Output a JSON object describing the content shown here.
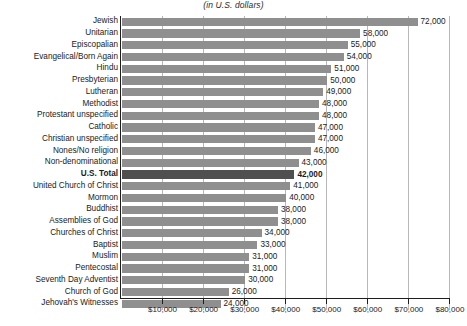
{
  "subtitle": "(in U.S. dollars)",
  "axis": {
    "tick_labels": [
      "$10,000",
      "$20,000",
      "$30,000",
      "$40,000",
      "$50,000",
      "$60,000",
      "$70,000",
      "$80,000"
    ]
  },
  "colors": {
    "bar": "#8f8f8f",
    "bar_highlight": "#4f4f4f",
    "gridline": "#b8b8b8",
    "axis": "#1d1d1d"
  },
  "chart_data": {
    "type": "bar",
    "title": "",
    "subtitle": "(in U.S. dollars)",
    "xlabel": "",
    "ylabel": "",
    "orientation": "horizontal",
    "xlim": [
      0,
      80000
    ],
    "xtick_values": [
      10000,
      20000,
      30000,
      40000,
      50000,
      60000,
      70000,
      80000
    ],
    "xtick_labels": [
      "$10,000",
      "$20,000",
      "$30,000",
      "$40,000",
      "$50,000",
      "$60,000",
      "$70,000",
      "$80,000"
    ],
    "grid": "vertical",
    "legend": "none",
    "highlight_category": "U.S. Total",
    "categories": [
      "Jewish",
      "Unitarian",
      "Episcopalian",
      "Evangelical/Born Again",
      "Hindu",
      "Presbyterian",
      "Lutheran",
      "Methodist",
      "Protestant unspecified",
      "Catholic",
      "Christian unspecified",
      "Nones/No religion",
      "Non-denominational",
      "U.S. Total",
      "United Church of Christ",
      "Mormon",
      "Buddhist",
      "Assemblies of God",
      "Churches of Christ",
      "Baptist",
      "Muslim",
      "Pentecostal",
      "Seventh Day Adventist",
      "Church of God",
      "Jehovah's Witnesses"
    ],
    "values": [
      72000,
      58000,
      55000,
      54000,
      51000,
      50000,
      49000,
      48000,
      48000,
      47000,
      47000,
      46000,
      43000,
      42000,
      41000,
      40000,
      38000,
      38000,
      34000,
      33000,
      31000,
      31000,
      30000,
      26000,
      24000
    ],
    "value_labels": [
      "72,000",
      "58,000",
      "55,000",
      "54,000",
      "51,000",
      "50,000",
      "49,000",
      "48,000",
      "48,000",
      "47,000",
      "47,000",
      "46,000",
      "43,000",
      "42,000",
      "41,000",
      "40,000",
      "38,000",
      "38,000",
      "34,000",
      "33,000",
      "31,000",
      "31,000",
      "30,000",
      "26,000",
      "24,000"
    ]
  }
}
